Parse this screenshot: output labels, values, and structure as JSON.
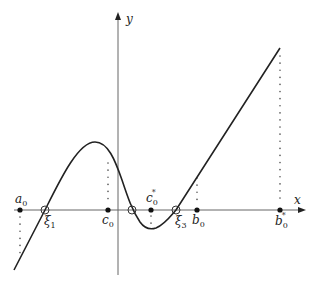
{
  "diagram": {
    "axes": {
      "x_label": "x",
      "y_label": "y"
    },
    "points": [
      {
        "id": "a0",
        "base": "a",
        "sub": "0",
        "sup": "",
        "kind": "filled"
      },
      {
        "id": "xi1",
        "base": "ξ",
        "sub": "1",
        "sup": "",
        "kind": "hollow"
      },
      {
        "id": "c0",
        "base": "c",
        "sub": "0",
        "sup": "",
        "kind": "filled"
      },
      {
        "id": "xi2",
        "base": "",
        "sub": "",
        "sup": "",
        "kind": "hollow"
      },
      {
        "id": "c0star",
        "base": "c",
        "sub": "0",
        "sup": "*",
        "kind": "filled"
      },
      {
        "id": "xi3",
        "base": "ξ",
        "sub": "3",
        "sup": "",
        "kind": "hollow"
      },
      {
        "id": "b0",
        "base": "b",
        "sub": "0",
        "sup": "",
        "kind": "filled"
      },
      {
        "id": "b0star",
        "base": "b",
        "sub": "0",
        "sup": "*",
        "kind": "filled"
      }
    ],
    "curve_description": "Function with local max left of y-axis, local min right of y-axis, three roots ξ1, ξ2, ξ3, then rising linearly"
  }
}
